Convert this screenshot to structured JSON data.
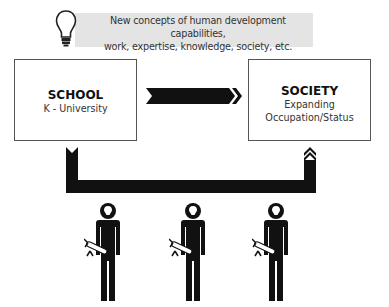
{
  "banner": {
    "icon": "lightbulb-icon",
    "line1": "New concepts of human development capabilities,",
    "line2": "work, expertise, knowledge, society, etc."
  },
  "school_box": {
    "title": "SCHOOL",
    "subtitle": "K - University"
  },
  "society_box": {
    "title": "SOCIETY",
    "line1": "Expanding",
    "line2": "Occupation/Status"
  },
  "flows": [
    {
      "from": "SCHOOL",
      "to": "SOCIETY",
      "type": "right-arrow"
    },
    {
      "from": "SCHOOL",
      "to": "SOCIETY",
      "type": "u-shaped-return-arrow",
      "via": "people"
    }
  ],
  "figures": [
    {
      "icon": "person-with-diploma-icon",
      "head_icon": "lightbulb-icon"
    },
    {
      "icon": "person-with-diploma-icon",
      "head_icon": "lightbulb-icon"
    },
    {
      "icon": "person-with-diploma-icon",
      "head_icon": "lightbulb-icon"
    }
  ],
  "colors": {
    "banner_bg": "#e4e4e4",
    "arrow": "#111111",
    "box_border": "#555555"
  }
}
